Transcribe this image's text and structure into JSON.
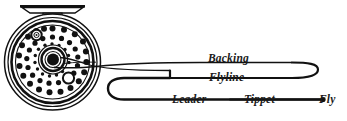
{
  "diagram": {
    "colors": {
      "ink": "#111111",
      "background": "#ffffff"
    },
    "labels": {
      "backing": "Backing",
      "flyline": "Flyline",
      "leader": "Leader",
      "tippet": "Tippet",
      "fly": "Fly"
    },
    "components": {
      "reel": "fly-reel",
      "reel_foot": "reel-foot",
      "spool_arbor": "spool-arbor",
      "drag_knob": "drag-knob",
      "port_hole": "spool-port-hole",
      "line_guide_holes": "spool-vent-holes",
      "fly_tip": "fly-hook-point"
    }
  }
}
